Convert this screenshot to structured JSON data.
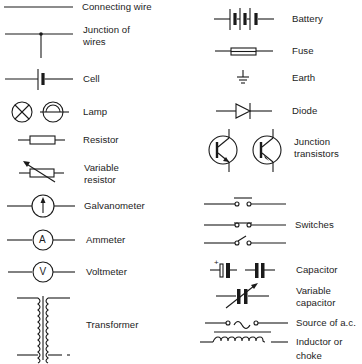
{
  "left_column": [
    {
      "id": "connecting-wire",
      "label": "Connecting wire",
      "icon": "connecting-wire-symbol"
    },
    {
      "id": "junction-of-wires",
      "label": "Junction of\nwires",
      "icon": "junction-of-wires-symbol"
    },
    {
      "id": "cell",
      "label": "Cell",
      "icon": "cell-symbol"
    },
    {
      "id": "lamp",
      "label": "Lamp",
      "icon": "lamp-symbol"
    },
    {
      "id": "resistor",
      "label": "Resistor",
      "icon": "resistor-symbol"
    },
    {
      "id": "variable-resistor",
      "label": "Variable\nresistor",
      "icon": "variable-resistor-symbol"
    },
    {
      "id": "galvanometer",
      "label": "Galvanometer",
      "icon": "galvanometer-symbol"
    },
    {
      "id": "ammeter",
      "label": "Ammeter",
      "icon": "ammeter-symbol",
      "glyph": "A"
    },
    {
      "id": "voltmeter",
      "label": "Voltmeter",
      "icon": "voltmeter-symbol",
      "glyph": "V"
    },
    {
      "id": "transformer",
      "label": "Transformer",
      "icon": "transformer-symbol"
    }
  ],
  "right_column": [
    {
      "id": "battery",
      "label": "Battery",
      "icon": "battery-symbol"
    },
    {
      "id": "fuse",
      "label": "Fuse",
      "icon": "fuse-symbol"
    },
    {
      "id": "earth",
      "label": "Earth",
      "icon": "earth-symbol"
    },
    {
      "id": "diode",
      "label": "Diode",
      "icon": "diode-symbol"
    },
    {
      "id": "junction-transistors",
      "label": "Junction\ntransistors",
      "icon": "junction-transistors-symbol"
    },
    {
      "id": "switches",
      "label": "Switches",
      "icon": "switches-symbol"
    },
    {
      "id": "capacitor",
      "label": "Capacitor",
      "icon": "capacitor-symbol",
      "polarity_mark": "+"
    },
    {
      "id": "variable-capacitor",
      "label": "Variable\ncapacitor",
      "icon": "variable-capacitor-symbol"
    },
    {
      "id": "source-of-ac",
      "label": "Source of a.c.",
      "icon": "ac-source-symbol"
    },
    {
      "id": "inductor-or-choke",
      "label": "Inductor or\nchoke",
      "icon": "inductor-symbol"
    }
  ],
  "colors": {
    "background": "#ffffff",
    "ink": "#1a1a1a"
  }
}
